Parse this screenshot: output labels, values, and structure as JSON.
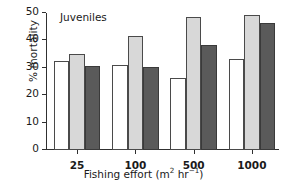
{
  "chart_data": {
    "type": "bar",
    "title": "Juveniles",
    "xlabel": "Fishing effort (m² hr⁻¹)",
    "xlabel_parts": {
      "base": "Fishing effort (m",
      "sup1": "2",
      "mid": " hr",
      "sup2": "−1",
      "tail": ")"
    },
    "ylabel": "% mortality",
    "categories": [
      "25",
      "100",
      "500",
      "1000"
    ],
    "series": [
      {
        "name": "series-1",
        "color": "#ffffff",
        "values": [
          32.5,
          31.2,
          26.3,
          33.1
        ]
      },
      {
        "name": "series-2",
        "color": "#d8d8d8",
        "values": [
          35.2,
          41.7,
          48.6,
          49.4
        ]
      },
      {
        "name": "series-3",
        "color": "#5a5a5a",
        "values": [
          30.8,
          30.4,
          38.2,
          46.2
        ]
      }
    ],
    "ylim": [
      0,
      50
    ],
    "yticks": [
      0,
      10,
      20,
      30,
      40,
      50
    ],
    "ytick_labels": [
      "0",
      "10",
      "20",
      "30",
      "40",
      "50"
    ],
    "grid": false,
    "legend": "none",
    "bar_edge_color": "#4a4a4a"
  }
}
